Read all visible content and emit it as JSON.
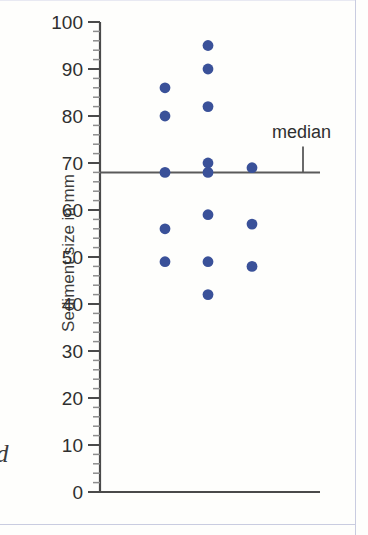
{
  "figure": {
    "caption_fragment": "d",
    "median_label": "median"
  },
  "chart_data": {
    "type": "scatter",
    "title": "",
    "xlabel": "",
    "ylabel": "Sediment size in mm",
    "ylim": [
      0,
      100
    ],
    "xlim": [
      0,
      3.5
    ],
    "grid": false,
    "legend": "none",
    "y_ticks": [
      0,
      10,
      20,
      30,
      40,
      50,
      60,
      70,
      80,
      90,
      100
    ],
    "y_tick_labels": [
      "0",
      "10",
      "20",
      "30",
      "40",
      "50",
      "60",
      "70",
      "80",
      "90",
      "100"
    ],
    "y_minor_tick_step": 2,
    "x_axis_visible": true,
    "x_tick_labels": [],
    "series": [
      {
        "name": "Sample 1",
        "x": 1,
        "values": [
          86,
          80,
          68,
          56,
          49
        ]
      },
      {
        "name": "Sample 2",
        "x": 2,
        "values": [
          95,
          90,
          82,
          70,
          68,
          59,
          49,
          42
        ]
      },
      {
        "name": "Sample 3",
        "x": 3,
        "values": [
          69,
          57,
          48
        ]
      }
    ],
    "points": [
      {
        "x": 1,
        "y": 86
      },
      {
        "x": 1,
        "y": 80
      },
      {
        "x": 1,
        "y": 68
      },
      {
        "x": 1,
        "y": 56
      },
      {
        "x": 1,
        "y": 49
      },
      {
        "x": 2,
        "y": 95
      },
      {
        "x": 2,
        "y": 90
      },
      {
        "x": 2,
        "y": 82
      },
      {
        "x": 2,
        "y": 70
      },
      {
        "x": 2,
        "y": 68
      },
      {
        "x": 2,
        "y": 59
      },
      {
        "x": 2,
        "y": 49
      },
      {
        "x": 2,
        "y": 42
      },
      {
        "x": 3,
        "y": 69
      },
      {
        "x": 3,
        "y": 57
      },
      {
        "x": 3,
        "y": 48
      }
    ],
    "annotations": [
      {
        "type": "hline",
        "label": "median",
        "value": 68
      }
    ],
    "colors": {
      "marker": "#3a5199",
      "axis": "#4a4a4a",
      "median_line": "#5a5a5a",
      "background": "#fefefc"
    }
  }
}
